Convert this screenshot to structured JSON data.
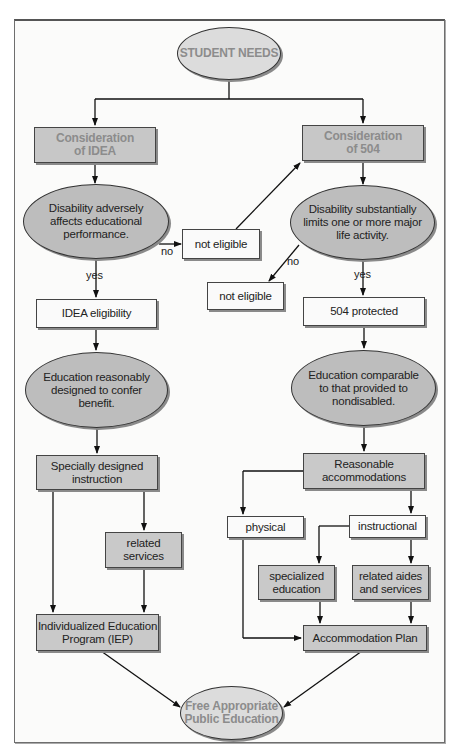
{
  "diagram": {
    "type": "flowchart",
    "nodes": {
      "student_needs": "STUDENT NEEDS",
      "consideration_idea": [
        "Consideration",
        "of IDEA"
      ],
      "consideration_504": [
        "Consideration",
        "of 504"
      ],
      "idea_decision": [
        "Disability adversely",
        "affects educational",
        "performance."
      ],
      "s504_decision": [
        "Disability substantially",
        "limits one or more major",
        "life activity."
      ],
      "not_eligible_idea": "not eligible",
      "not_eligible_504": "not eligible",
      "idea_eligibility": "IDEA eligibility",
      "protected_504": "504 protected",
      "idea_standard": [
        "Education reasonably",
        "designed to confer",
        "benefit."
      ],
      "s504_standard": [
        "Education comparable",
        "to that provided to",
        "nondisabled."
      ],
      "specially_designed": [
        "Specially designed",
        "instruction"
      ],
      "reasonable_accommodations": [
        "Reasonable",
        "accommodations"
      ],
      "related_services": [
        "related",
        "services"
      ],
      "physical": "physical",
      "instructional": "instructional",
      "specialized_education": [
        "specialized",
        "education"
      ],
      "related_aides": [
        "related aides",
        "and services"
      ],
      "iep": [
        "Individualized Education",
        "Program (IEP)"
      ],
      "accommodation_plan": "Accommodation Plan",
      "fape": [
        "Free Appropriate",
        "Public Education"
      ]
    },
    "edge_labels": {
      "idea_no": "no",
      "idea_yes": "yes",
      "s504_no": "no",
      "s504_yes": "yes"
    },
    "edges": [
      [
        "student_needs",
        "consideration_idea"
      ],
      [
        "student_needs",
        "consideration_504"
      ],
      [
        "consideration_idea",
        "idea_decision"
      ],
      [
        "idea_decision",
        "not_eligible_idea",
        "no"
      ],
      [
        "not_eligible_idea",
        "consideration_504"
      ],
      [
        "idea_decision",
        "idea_eligibility",
        "yes"
      ],
      [
        "consideration_504",
        "s504_decision"
      ],
      [
        "s504_decision",
        "not_eligible_504",
        "no"
      ],
      [
        "s504_decision",
        "protected_504",
        "yes"
      ],
      [
        "idea_eligibility",
        "idea_standard"
      ],
      [
        "protected_504",
        "s504_standard"
      ],
      [
        "idea_standard",
        "specially_designed"
      ],
      [
        "s504_standard",
        "reasonable_accommodations"
      ],
      [
        "specially_designed",
        "iep"
      ],
      [
        "specially_designed",
        "related_services"
      ],
      [
        "related_services",
        "iep"
      ],
      [
        "reasonable_accommodations",
        "physical"
      ],
      [
        "reasonable_accommodations",
        "instructional"
      ],
      [
        "instructional",
        "specialized_education"
      ],
      [
        "instructional",
        "related_aides"
      ],
      [
        "physical",
        "accommodation_plan"
      ],
      [
        "specialized_education",
        "accommodation_plan"
      ],
      [
        "related_aides",
        "accommodation_plan"
      ],
      [
        "iep",
        "fape"
      ],
      [
        "accommodation_plan",
        "fape"
      ]
    ],
    "colors": {
      "box_gray": "#c9c9c9",
      "ellipse_dark": "#bdbdbd",
      "ellipse_light": "#dcdcdc",
      "header_text": "#8c8c8c",
      "line": "#111111"
    }
  }
}
